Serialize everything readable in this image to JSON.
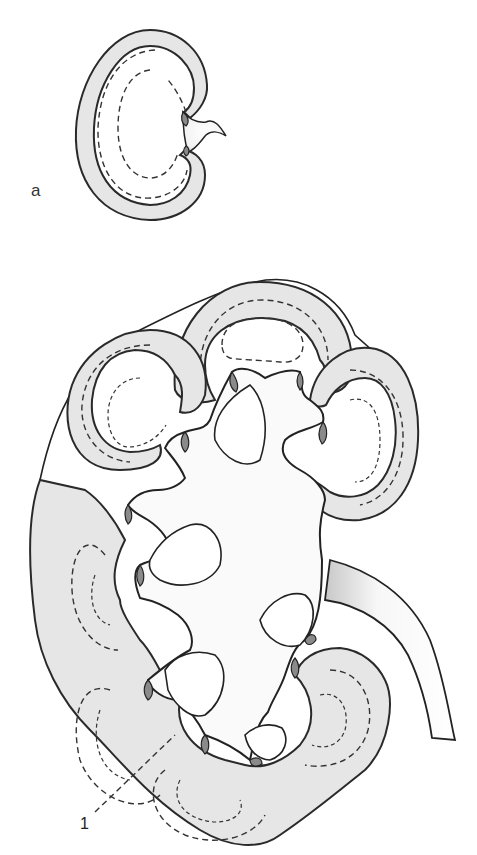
{
  "figure": {
    "panel_label": "a",
    "callouts": [
      {
        "id": "1",
        "text": "1"
      }
    ],
    "colors": {
      "cortex_fill": "#e6e6e6",
      "outline": "#222222",
      "papilla": "#8a8a8a",
      "background": "#ffffff"
    },
    "elements": {
      "small_kidney": "single-lobe kidney with dashed medulla outlines and hilum",
      "large_kidney": "multilobar kidney with renal pelvis, calyces and ureter"
    }
  }
}
